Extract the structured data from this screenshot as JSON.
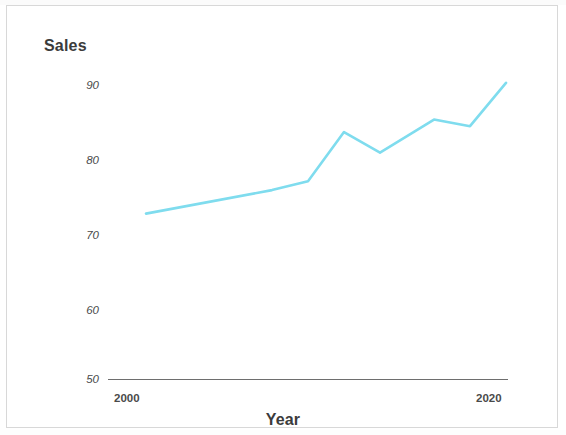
{
  "chart_data": {
    "type": "line",
    "title": "",
    "xlabel": "Year",
    "ylabel": "Sales",
    "xlim": [
      2000,
      2020
    ],
    "ylim": [
      50,
      90
    ],
    "grid": false,
    "legend": null,
    "line_color": "#7fdcee",
    "x_ticks": [
      "2000",
      "2020"
    ],
    "x_tick_values": [
      2000,
      2020
    ],
    "y_ticks": [
      "50",
      "60",
      "70",
      "80",
      "90"
    ],
    "y_tick_values": [
      50,
      60,
      70,
      80,
      90
    ],
    "series": [
      {
        "name": "Sales",
        "color": "#7fdcee",
        "x": [
          2001,
          2008,
          2010,
          2012,
          2014,
          2017,
          2019,
          2021
        ],
        "values": [
          72.5,
          75.7,
          76.9,
          83.6,
          80.8,
          85.3,
          84.4,
          90.3
        ]
      }
    ]
  },
  "labels": {
    "y_axis_title": "Sales",
    "x_axis_title": "Year",
    "y_tick_90": "90",
    "y_tick_80": "80",
    "y_tick_70": "70",
    "y_tick_60": "60",
    "y_tick_50": "50",
    "x_tick_2000": "2000",
    "x_tick_2020": "2020"
  }
}
